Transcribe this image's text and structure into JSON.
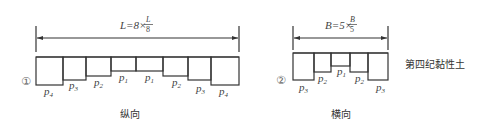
{
  "longitudinal": {
    "formula_prefix": "L=8×",
    "formula_num": "L",
    "formula_den": "8",
    "marker": "①",
    "caption": "纵向",
    "segments": [
      {
        "label": "p",
        "sub": "4"
      },
      {
        "label": "p",
        "sub": "3"
      },
      {
        "label": "p",
        "sub": "2"
      },
      {
        "label": "p",
        "sub": "1"
      },
      {
        "label": "p",
        "sub": "1"
      },
      {
        "label": "p",
        "sub": "2"
      },
      {
        "label": "p",
        "sub": "3"
      },
      {
        "label": "p",
        "sub": "4"
      }
    ]
  },
  "transverse": {
    "formula_prefix": "B=5×",
    "formula_num": "B",
    "formula_den": "5",
    "marker": "②",
    "caption": "横向",
    "segments": [
      {
        "label": "p",
        "sub": "3"
      },
      {
        "label": "p",
        "sub": "2"
      },
      {
        "label": "p",
        "sub": "1"
      },
      {
        "label": "p",
        "sub": "2"
      },
      {
        "label": "p",
        "sub": "3"
      }
    ]
  },
  "soil_label": "第四纪黏性土"
}
